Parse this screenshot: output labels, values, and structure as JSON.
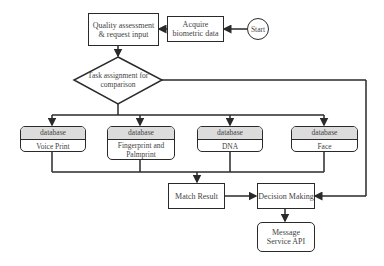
{
  "diagram": {
    "nodes": {
      "start": "Start",
      "acquire": "Acquire biometric data",
      "quality": "Quality assessment & request input",
      "task": "Task assignment for comparison",
      "db_voice": {
        "header": "database",
        "label": "Voice Print"
      },
      "db_finger": {
        "header": "database",
        "label": "Fingerprint and Palmprint"
      },
      "db_dna": {
        "header": "database",
        "label": "DNA"
      },
      "db_face": {
        "header": "database",
        "label": "Face"
      },
      "match": "Match Result",
      "decision": "Decision Making",
      "message": "Message Service API"
    },
    "edges": [
      [
        "start",
        "acquire"
      ],
      [
        "acquire",
        "quality"
      ],
      [
        "quality",
        "task"
      ],
      [
        "task",
        "db_voice"
      ],
      [
        "task",
        "db_finger"
      ],
      [
        "task",
        "db_dna"
      ],
      [
        "task",
        "db_face"
      ],
      [
        "db_voice",
        "match"
      ],
      [
        "db_finger",
        "match"
      ],
      [
        "db_dna",
        "match"
      ],
      [
        "db_face",
        "match"
      ],
      [
        "match",
        "decision"
      ],
      [
        "task",
        "decision"
      ],
      [
        "decision",
        "message"
      ]
    ]
  }
}
